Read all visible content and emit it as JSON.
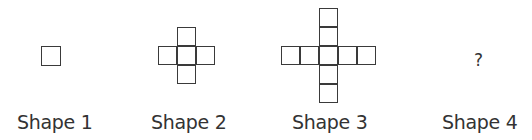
{
  "figure": {
    "shapes": [
      {
        "label": "Shape 1",
        "arms": 0
      },
      {
        "label": "Shape 2",
        "arms": 1
      },
      {
        "label": "Shape 3",
        "arms": 2
      },
      {
        "label": "Shape 4",
        "unknown": "?"
      }
    ],
    "colors": {
      "stroke": "#3a3a3a",
      "text": "#333333",
      "background": "#ffffff"
    }
  }
}
